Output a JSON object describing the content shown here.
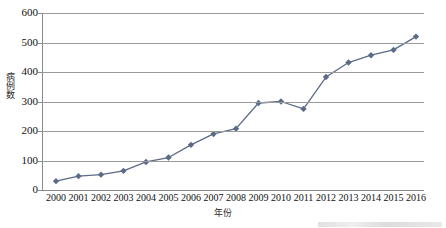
{
  "chart_data": {
    "type": "line",
    "title": "",
    "xlabel": "年份",
    "ylabel": "病例数",
    "categories": [
      "2000",
      "2001",
      "2002",
      "2003",
      "2004",
      "2005",
      "2006",
      "2007",
      "2008",
      "2009",
      "2010",
      "2011",
      "2012",
      "2013",
      "2014",
      "2015",
      "2016"
    ],
    "values": [
      30,
      47,
      52,
      65,
      95,
      110,
      153,
      190,
      208,
      295,
      300,
      275,
      383,
      432,
      457,
      475,
      520
    ],
    "series": [
      {
        "name": "病例数",
        "values": [
          30,
          47,
          52,
          65,
          95,
          110,
          153,
          190,
          208,
          295,
          300,
          275,
          383,
          432,
          457,
          475,
          520
        ]
      }
    ],
    "ylim": [
      0,
      600
    ],
    "yticks": [
      0,
      100,
      200,
      300,
      400,
      500,
      600
    ],
    "ytick_labels": [
      "0",
      "100",
      "200",
      "300",
      "400",
      "500",
      "600"
    ],
    "grid": true,
    "grid_axis": "y",
    "legend": false,
    "legend_position": "none",
    "marker": "diamond",
    "series_color": "#5b6b87",
    "grid_color": "#9a9a9a",
    "axis_color": "#8a8a8a",
    "background_color": "#ffffff"
  }
}
